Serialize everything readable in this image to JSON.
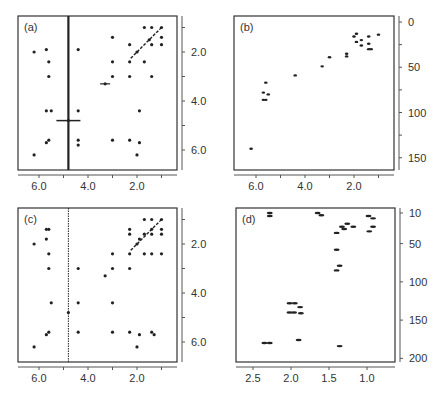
{
  "chart_data": [
    {
      "panel": "(a)",
      "type": "scatter",
      "title": "(a)",
      "xlabel": "",
      "ylabel": "",
      "x_ticks": [
        "6.0",
        "4.0",
        "2.0"
      ],
      "y_ticks": [
        "2.0",
        "4.0",
        "6.0"
      ],
      "xlim": [
        6.8,
        0.5
      ],
      "ylim": [
        0.5,
        6.8
      ],
      "vertical_line_x": 4.8,
      "points": [
        [
          6.2,
          2.0
        ],
        [
          5.7,
          1.9
        ],
        [
          5.6,
          2.4
        ],
        [
          5.6,
          3.0
        ],
        [
          5.7,
          4.4
        ],
        [
          5.5,
          4.4
        ],
        [
          5.7,
          5.7
        ],
        [
          5.6,
          5.6
        ],
        [
          6.2,
          6.2
        ],
        [
          4.4,
          1.9
        ],
        [
          4.4,
          4.4
        ],
        [
          4.4,
          5.6
        ],
        [
          4.4,
          5.8
        ],
        [
          4.8,
          4.8
        ],
        [
          3.3,
          3.3
        ],
        [
          3.0,
          1.4
        ],
        [
          3.0,
          2.4
        ],
        [
          3.0,
          3.0
        ],
        [
          3.0,
          5.6
        ],
        [
          2.3,
          1.7
        ],
        [
          2.3,
          2.4
        ],
        [
          2.3,
          3.0
        ],
        [
          2.3,
          5.6
        ],
        [
          2.0,
          2.0
        ],
        [
          2.0,
          6.2
        ],
        [
          1.9,
          4.4
        ],
        [
          1.9,
          5.7
        ],
        [
          1.7,
          1.0
        ],
        [
          1.7,
          2.4
        ],
        [
          1.5,
          1.5
        ],
        [
          1.4,
          1.0
        ],
        [
          1.4,
          1.7
        ],
        [
          1.4,
          3.0
        ],
        [
          1.0,
          1.0
        ],
        [
          1.0,
          1.4
        ],
        [
          1.0,
          1.7
        ]
      ]
    },
    {
      "panel": "(b)",
      "type": "scatter",
      "title": "(b)",
      "xlabel": "",
      "ylabel": "",
      "x_ticks": [
        "6.0",
        "4.0",
        "2.0"
      ],
      "y_ticks": [
        "0",
        "50",
        "100",
        "150"
      ],
      "xlim": [
        6.8,
        0.5
      ],
      "ylim": [
        -5,
        160
      ],
      "points": [
        [
          6.2,
          140
        ],
        [
          5.7,
          78
        ],
        [
          5.6,
          67
        ],
        [
          5.5,
          80
        ],
        [
          5.7,
          86
        ],
        [
          5.6,
          86
        ],
        [
          4.4,
          59
        ],
        [
          3.3,
          49
        ],
        [
          3.0,
          39
        ],
        [
          2.3,
          35
        ],
        [
          2.3,
          38
        ],
        [
          2.0,
          16
        ],
        [
          1.9,
          22
        ],
        [
          1.9,
          13
        ],
        [
          1.7,
          20
        ],
        [
          1.7,
          26
        ],
        [
          1.4,
          16
        ],
        [
          1.4,
          24
        ],
        [
          1.4,
          30
        ],
        [
          1.3,
          30
        ],
        [
          1.0,
          14
        ]
      ]
    },
    {
      "panel": "(c)",
      "type": "scatter",
      "title": "(c)",
      "xlabel": "",
      "ylabel": "",
      "x_ticks": [
        "6.0",
        "4.0",
        "2.0"
      ],
      "y_ticks": [
        "2.0",
        "4.0",
        "6.0"
      ],
      "xlim": [
        6.8,
        0.5
      ],
      "ylim": [
        0.5,
        6.8
      ],
      "vertical_line_x": 4.8,
      "points": [
        [
          6.2,
          2.0
        ],
        [
          5.7,
          1.4
        ],
        [
          5.6,
          1.4
        ],
        [
          5.7,
          1.8
        ],
        [
          5.6,
          2.4
        ],
        [
          5.6,
          3.0
        ],
        [
          5.5,
          4.4
        ],
        [
          5.7,
          5.7
        ],
        [
          5.6,
          5.6
        ],
        [
          6.2,
          6.2
        ],
        [
          4.4,
          3.0
        ],
        [
          4.4,
          4.4
        ],
        [
          4.4,
          5.6
        ],
        [
          4.8,
          4.8
        ],
        [
          3.3,
          3.3
        ],
        [
          3.0,
          2.4
        ],
        [
          3.0,
          3.0
        ],
        [
          3.0,
          4.4
        ],
        [
          3.0,
          5.6
        ],
        [
          2.3,
          1.4
        ],
        [
          2.3,
          1.6
        ],
        [
          2.3,
          2.4
        ],
        [
          2.3,
          3.0
        ],
        [
          2.3,
          5.6
        ],
        [
          2.0,
          2.0
        ],
        [
          1.9,
          1.8
        ],
        [
          2.0,
          6.2
        ],
        [
          1.9,
          5.7
        ],
        [
          1.7,
          1.0
        ],
        [
          1.7,
          1.6
        ],
        [
          1.7,
          2.4
        ],
        [
          1.4,
          1.0
        ],
        [
          1.4,
          1.4
        ],
        [
          1.4,
          1.6
        ],
        [
          1.4,
          2.4
        ],
        [
          1.4,
          5.6
        ],
        [
          1.3,
          5.7
        ],
        [
          1.0,
          1.0
        ],
        [
          1.0,
          1.4
        ],
        [
          1.0,
          1.6
        ],
        [
          1.0,
          2.4
        ]
      ]
    },
    {
      "panel": "(d)",
      "type": "scatter",
      "title": "(d)",
      "xlabel": "",
      "ylabel": "",
      "x_ticks": [
        "2.5",
        "2.0",
        "1.5",
        "1.0"
      ],
      "y_ticks": [
        "10",
        "50",
        "100",
        "150",
        "200"
      ],
      "xlim": [
        2.7,
        0.6
      ],
      "ylim": [
        0,
        205
      ],
      "points": [
        [
          2.28,
          10
        ],
        [
          2.28,
          14
        ],
        [
          1.65,
          10
        ],
        [
          1.6,
          13
        ],
        [
          1.26,
          24
        ],
        [
          1.33,
          28
        ],
        [
          1.18,
          28
        ],
        [
          1.3,
          31
        ],
        [
          0.98,
          14
        ],
        [
          0.92,
          17
        ],
        [
          0.92,
          28
        ],
        [
          0.97,
          34
        ],
        [
          1.4,
          36
        ],
        [
          1.4,
          58
        ],
        [
          1.36,
          79
        ],
        [
          1.4,
          85
        ],
        [
          2.02,
          128
        ],
        [
          1.95,
          128
        ],
        [
          1.88,
          133
        ],
        [
          2.02,
          140
        ],
        [
          1.96,
          140
        ],
        [
          1.87,
          141
        ],
        [
          1.9,
          176
        ],
        [
          2.35,
          180
        ],
        [
          2.28,
          180
        ],
        [
          1.36,
          184
        ]
      ]
    }
  ],
  "panels": {
    "a": {
      "label": "(a)",
      "xticks": [
        "6.0",
        "4.0",
        "2.0"
      ],
      "yticks": [
        "2.0",
        "4.0",
        "6.0"
      ]
    },
    "b": {
      "label": "(b)",
      "xticks": [
        "6.0",
        "4.0",
        "2.0"
      ],
      "yticks": [
        "0",
        "50",
        "100",
        "150"
      ]
    },
    "c": {
      "label": "(c)",
      "xticks": [
        "6.0",
        "4.0",
        "2.0"
      ],
      "yticks": [
        "2.0",
        "4.0",
        "6.0"
      ]
    },
    "d": {
      "label": "(d)",
      "xticks": [
        "2.5",
        "2.0",
        "1.5",
        "1.0"
      ],
      "yticks": [
        "10",
        "50",
        "100",
        "150",
        "200"
      ]
    }
  }
}
